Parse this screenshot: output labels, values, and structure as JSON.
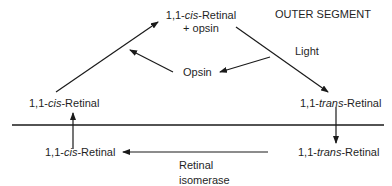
{
  "diagram": {
    "region_label": "OUTER SEGMENT",
    "nodes": {
      "top": {
        "line1_prefix": "1,1-",
        "line1_italic": "cis",
        "line1_suffix": "-Retinal",
        "line2": "+ opsin"
      },
      "left_upper": {
        "prefix": "1,1-",
        "italic": "cis",
        "suffix": "-Retinal"
      },
      "right_upper": {
        "prefix": "1,1-",
        "italic": "trans",
        "suffix": "-Retinal"
      },
      "left_lower": {
        "prefix": "1,1-",
        "italic": "cis",
        "suffix": "-Retinal"
      },
      "right_lower": {
        "prefix": "1,1-",
        "italic": "trans",
        "suffix": "-Retinal"
      },
      "opsin": "Opsin"
    },
    "edge_labels": {
      "light": "Light",
      "enzyme_line1": "Retinal",
      "enzyme_line2": "isomerase"
    },
    "colors": {
      "stroke": "#1a1a1a",
      "background": "#ffffff"
    }
  }
}
